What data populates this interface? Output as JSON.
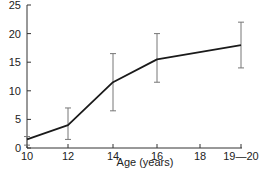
{
  "chart_data": {
    "type": "line",
    "title": "",
    "xlabel": "Age (years)",
    "ylabel": "",
    "x": [
      "10",
      "12",
      "14",
      "16",
      "19—20"
    ],
    "x_positions": [
      10,
      12,
      14,
      16,
      19.5
    ],
    "x_tick_labels": [
      "10",
      "12",
      "14",
      "16",
      "18",
      "19—20"
    ],
    "y_ticks": [
      0,
      5,
      10,
      15,
      20,
      25
    ],
    "ylim": [
      0,
      25
    ],
    "grid": false,
    "legend": null,
    "series": [
      {
        "name": "mean",
        "values": [
          1.5,
          4,
          11.5,
          15.5,
          18
        ],
        "error_low": [
          0.5,
          1.5,
          6.5,
          11.5,
          14
        ],
        "error_high": [
          2,
          7,
          16.5,
          20,
          22
        ]
      }
    ],
    "colors": {
      "line": "#1a1a1a",
      "error_bar": "#777777",
      "axis": "#333333"
    }
  }
}
